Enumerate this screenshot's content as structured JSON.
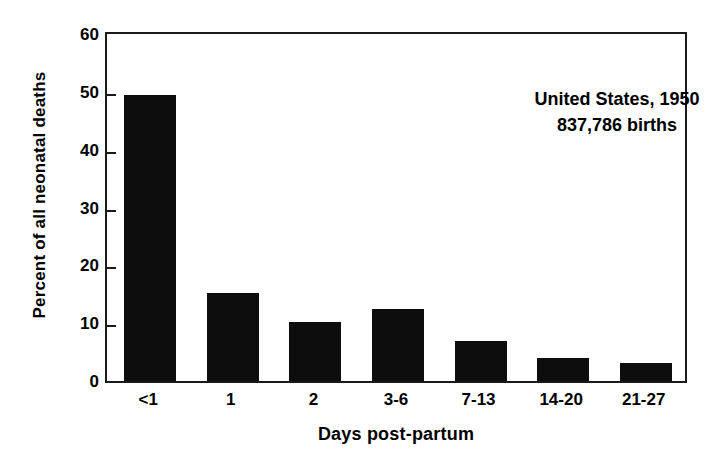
{
  "chart_data": {
    "type": "bar",
    "title": "",
    "subtitle": "",
    "xlabel": "Days post-partum",
    "ylabel": "Percent of all neonatal deaths",
    "categories": [
      "<1",
      "1",
      "2",
      "3-6",
      "7-13",
      "14-20",
      "21-27"
    ],
    "values": [
      49.5,
      15.2,
      10.2,
      12.4,
      6.9,
      4.0,
      3.1
    ],
    "ylim": [
      0,
      60
    ],
    "yticks": [
      0,
      10,
      20,
      30,
      40,
      50,
      60
    ],
    "ytick_labels": [
      "0",
      "10",
      "20",
      "30",
      "40",
      "50",
      "60"
    ],
    "grid": false,
    "legend": false,
    "bar_color": "#0d0d0d",
    "axis_color": "#1a1a1a",
    "annotations": [
      "United States, 1950",
      "837,786 births"
    ]
  }
}
